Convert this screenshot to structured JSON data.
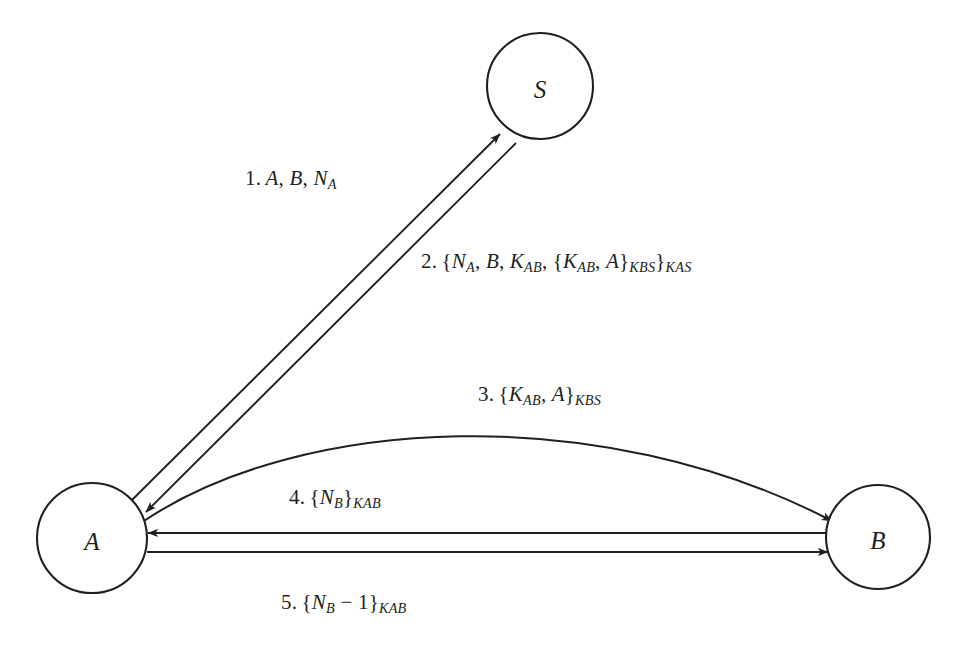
{
  "diagram": {
    "background_color": "#ffffff",
    "stroke_color": "#231f20",
    "nodes": [
      {
        "id": "S",
        "label": "S",
        "cx": 540,
        "cy": 86,
        "r": 53
      },
      {
        "id": "A",
        "label": "A",
        "cx": 92,
        "cy": 538,
        "r": 55
      },
      {
        "id": "B",
        "label": "B",
        "cx": 878,
        "cy": 537,
        "r": 52
      }
    ],
    "messages": [
      {
        "number": "1.",
        "from": "A",
        "to": "S",
        "text": "1. A, B, NA",
        "parts": [
          {
            "t": "num",
            "v": "1."
          },
          {
            "t": "it",
            "v": "A"
          },
          {
            "t": "plain",
            "v": ", "
          },
          {
            "t": "it",
            "v": "B"
          },
          {
            "t": "plain",
            "v": ", "
          },
          {
            "t": "it",
            "v": "N"
          },
          {
            "t": "sub",
            "v": "A"
          }
        ]
      },
      {
        "number": "2.",
        "from": "S",
        "to": "A",
        "text": "2. {NA, B, KAB, {KAB, A}KBS}KAS",
        "parts": [
          {
            "t": "num",
            "v": "2."
          },
          {
            "t": "brace",
            "v": "{"
          },
          {
            "t": "it",
            "v": "N"
          },
          {
            "t": "sub",
            "v": "A"
          },
          {
            "t": "plain",
            "v": ", "
          },
          {
            "t": "it",
            "v": "B"
          },
          {
            "t": "plain",
            "v": ", "
          },
          {
            "t": "it",
            "v": "K"
          },
          {
            "t": "sub",
            "v": "AB"
          },
          {
            "t": "plain",
            "v": ", "
          },
          {
            "t": "brace",
            "v": "{"
          },
          {
            "t": "it",
            "v": "K"
          },
          {
            "t": "sub",
            "v": "AB"
          },
          {
            "t": "plain",
            "v": ", "
          },
          {
            "t": "it",
            "v": "A"
          },
          {
            "t": "brace",
            "v": "}"
          },
          {
            "t": "sub",
            "v": "KBS"
          },
          {
            "t": "brace",
            "v": "}"
          },
          {
            "t": "sub",
            "v": "KAS"
          }
        ]
      },
      {
        "number": "3.",
        "from": "A",
        "to": "B",
        "text": "3. {KAB, A}KBS",
        "parts": [
          {
            "t": "num",
            "v": "3."
          },
          {
            "t": "brace",
            "v": "{"
          },
          {
            "t": "it",
            "v": "K"
          },
          {
            "t": "sub",
            "v": "AB"
          },
          {
            "t": "plain",
            "v": ", "
          },
          {
            "t": "it",
            "v": "A"
          },
          {
            "t": "brace",
            "v": "}"
          },
          {
            "t": "sub",
            "v": "KBS"
          }
        ]
      },
      {
        "number": "4.",
        "from": "B",
        "to": "A",
        "text": "4. {NB}KAB",
        "parts": [
          {
            "t": "num",
            "v": "4."
          },
          {
            "t": "brace",
            "v": "{"
          },
          {
            "t": "it",
            "v": "N"
          },
          {
            "t": "sub",
            "v": "B"
          },
          {
            "t": "brace",
            "v": "}"
          },
          {
            "t": "sub",
            "v": "KAB"
          }
        ]
      },
      {
        "number": "5.",
        "from": "A",
        "to": "B",
        "text": "5. {NB − 1}KAB",
        "parts": [
          {
            "t": "num",
            "v": "5."
          },
          {
            "t": "brace",
            "v": "{"
          },
          {
            "t": "it",
            "v": "N"
          },
          {
            "t": "sub",
            "v": "B"
          },
          {
            "t": "op",
            "v": " − "
          },
          {
            "t": "num",
            "v": "1"
          },
          {
            "t": "brace",
            "v": "}"
          },
          {
            "t": "sub",
            "v": "KAB"
          }
        ]
      }
    ]
  }
}
